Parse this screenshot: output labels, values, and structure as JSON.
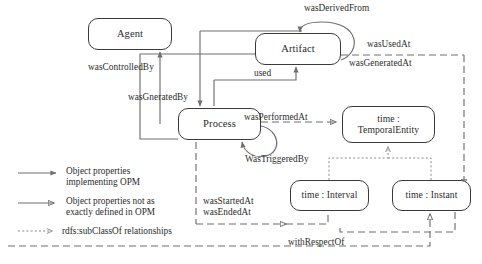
{
  "diagram": {
    "nodes": [
      {
        "id": "agent",
        "label": "Agent"
      },
      {
        "id": "artifact",
        "label": "Artifact"
      },
      {
        "id": "process",
        "label": "Process"
      },
      {
        "id": "temporal_entity",
        "label_line1": "time :",
        "label_line2": "TemporalEntity"
      },
      {
        "id": "interval",
        "label": "time : Interval"
      },
      {
        "id": "instant",
        "label": "time : Instant"
      }
    ],
    "edge_labels": [
      {
        "id": "was_derived_from",
        "text": "wasDerivedFrom"
      },
      {
        "id": "was_controlled_by",
        "text": "wasControlledBy"
      },
      {
        "id": "was_gnerated_by",
        "text": "wasGneratedBy"
      },
      {
        "id": "used",
        "text": "used"
      },
      {
        "id": "was_used_at",
        "text": "wasUsedAt"
      },
      {
        "id": "was_generated_at",
        "text": "wasGeneratedAt"
      },
      {
        "id": "was_performed_at",
        "text": "wasPerformedAt"
      },
      {
        "id": "was_triggered_by",
        "text": "WasTriggeredBy"
      },
      {
        "id": "was_started_at",
        "text": "wasStartedAt"
      },
      {
        "id": "was_ended_at",
        "text": "wasEndedAt"
      },
      {
        "id": "with_respect_of",
        "text": "withRespectOf"
      }
    ],
    "legend": [
      {
        "id": "solid-arrow",
        "line_style": "solid",
        "line1": "Object properties",
        "line2": "implementing OPM"
      },
      {
        "id": "open-arrow",
        "line_style": "solid-open",
        "line1": "Object properties not as",
        "line2": "exactly defined in OPM"
      },
      {
        "id": "dotted-arrow",
        "line_style": "dotted",
        "line1": "rdfs:subClassOf relationships",
        "line2": ""
      }
    ],
    "colors": {
      "line": "#6f6f6f",
      "node_border": "#3a3a3a",
      "text": "#2b2b2b",
      "background": "#ffffff"
    }
  }
}
